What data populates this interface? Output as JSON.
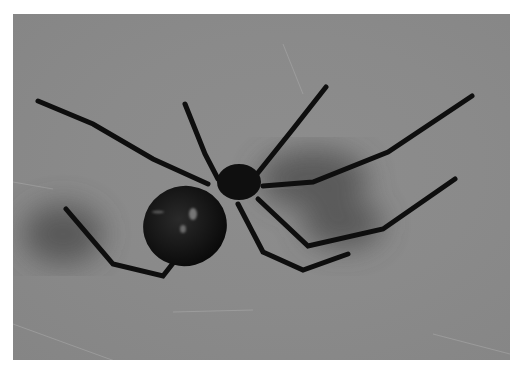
{
  "image": {
    "subject": "black widow spider",
    "style": "grayscale photograph",
    "background_color": "#8a8a8a",
    "spider_color": "#0e0e0e",
    "border_color": "#ffffff"
  }
}
